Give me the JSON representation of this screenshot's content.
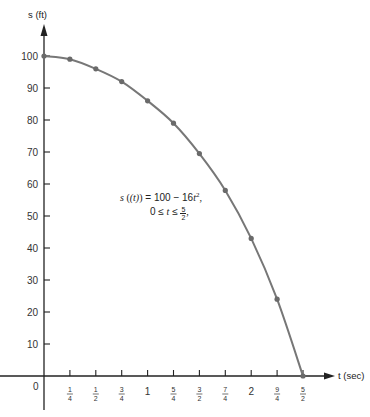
{
  "chart_data": {
    "type": "line",
    "title": "",
    "xlabel": "t (sec)",
    "ylabel": "s (ft)",
    "x_ticks": [
      "0",
      "1/4",
      "1/2",
      "3/4",
      "1",
      "5/4",
      "3/2",
      "7/4",
      "2",
      "9/4",
      "5/2"
    ],
    "x_tick_values": [
      0,
      0.25,
      0.5,
      0.75,
      1,
      1.25,
      1.5,
      1.75,
      2,
      2.25,
      2.5
    ],
    "y_ticks": [
      10,
      20,
      30,
      40,
      50,
      60,
      70,
      80,
      90,
      100
    ],
    "xlim": [
      0,
      2.5
    ],
    "ylim": [
      0,
      100
    ],
    "grid": false,
    "series": [
      {
        "name": "s(t) = 100 - 16t^2",
        "x": [
          0,
          0.25,
          0.5,
          0.75,
          1,
          1.25,
          1.5,
          1.75,
          2,
          2.25,
          2.5
        ],
        "values": [
          100,
          99,
          96,
          92,
          86,
          79,
          69.5,
          58,
          43,
          24,
          0
        ],
        "color": "#777777",
        "markers": true
      }
    ],
    "annotations": [
      "s (t) = 100 − 16t², 0 ≤ t ≤ 5/2"
    ]
  },
  "labels": {
    "y_axis": "s (ft)",
    "x_axis": "t (sec)",
    "origin": "0",
    "eq_line1_s": "s",
    "eq_line1_t": "(t)",
    "eq_line1_rest": " = 100 − 16",
    "eq_line1_var": "t",
    "eq_line1_exp": "2",
    "eq_line1_end": ",",
    "eq_line2_pre": "0 ≤ ",
    "eq_line2_var": "t",
    "eq_line2_mid": " ≤ ",
    "eq_line2_num": "5",
    "eq_line2_den": "2",
    "eq_line2_end": ","
  },
  "colors": {
    "axis": "#222222",
    "curve": "#777777",
    "marker": "#6a6a6a"
  }
}
